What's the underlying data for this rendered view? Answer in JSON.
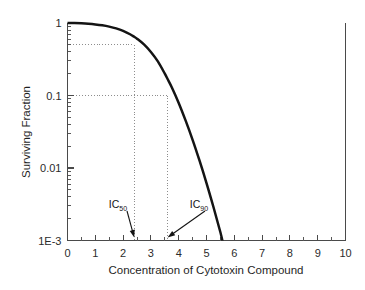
{
  "chart_data": {
    "type": "line",
    "title": "",
    "xlabel": "Concentration of Cytotoxin Compound",
    "ylabel": "Surviving Fraction",
    "xlim": [
      0,
      10
    ],
    "ylim": [
      0.001,
      1
    ],
    "yscale": "log",
    "xscale": "linear",
    "grid": false,
    "legend": "none",
    "x_ticks": [
      "0",
      "1",
      "2",
      "3",
      "4",
      "5",
      "6",
      "7",
      "8",
      "9",
      "10"
    ],
    "x_tick_values": [
      0,
      1,
      2,
      3,
      4,
      5,
      6,
      7,
      8,
      9,
      10
    ],
    "x_minor_step": 0.5,
    "y_ticks": [
      "1",
      "0.1",
      "0.01",
      "1E-3"
    ],
    "y_tick_values": [
      1,
      0.1,
      0.01,
      0.001
    ],
    "series": [
      {
        "name": "Surviving Fraction",
        "color": "#141414",
        "x": [
          0.0,
          0.25,
          0.5,
          0.75,
          1.0,
          1.25,
          1.5,
          1.75,
          2.0,
          2.25,
          2.4,
          2.5,
          2.75,
          3.0,
          3.25,
          3.5,
          3.6,
          3.75,
          4.0,
          4.25,
          4.5,
          4.75,
          5.0,
          5.25,
          5.5,
          5.75,
          6.0
        ],
        "y": [
          1.0,
          0.997,
          0.989,
          0.975,
          0.955,
          0.928,
          0.891,
          0.843,
          0.78,
          0.7,
          0.646,
          0.608,
          0.506,
          0.398,
          0.295,
          0.2,
          0.169,
          0.13,
          0.079,
          0.045,
          0.0245,
          0.0126,
          0.0062,
          0.0029,
          0.0013,
          0.00055,
          0.00022
        ]
      }
    ],
    "guides": [
      {
        "name": "ic50-guide",
        "y_value": 0.5,
        "x_value": 2.4,
        "label": "IC50"
      },
      {
        "name": "ic90-guide",
        "y_value": 0.1,
        "x_value": 3.6,
        "label": "IC90"
      }
    ],
    "annotations": [
      {
        "name": "ic50",
        "base": "IC",
        "subscript": "50",
        "x_value": 2.4,
        "points_to_x": 2.4
      },
      {
        "name": "ic90",
        "base": "IC",
        "subscript": "90",
        "x_value": 3.6,
        "points_to_x": 3.6
      }
    ]
  },
  "axes": {
    "x_title": "Concentration of Cytotoxin Compound",
    "y_title": "Surviving Fraction",
    "x_labels": [
      "0",
      "1",
      "2",
      "3",
      "4",
      "5",
      "6",
      "7",
      "8",
      "9",
      "10"
    ],
    "y_labels": [
      "1",
      "0.1",
      "0.01",
      "1E-3"
    ]
  },
  "annotations": {
    "ic50": {
      "base": "IC",
      "sub": "50"
    },
    "ic90": {
      "base": "IC",
      "sub": "90"
    }
  },
  "colors": {
    "curve": "#141414",
    "axis": "#4a4a4a",
    "guide": "#8d8d8d",
    "background": "#ffffff",
    "text": "#1f1f1f"
  }
}
